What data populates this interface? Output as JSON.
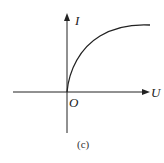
{
  "diagram": {
    "type": "I-U characteristic curve",
    "x_axis_label": "U",
    "y_axis_label": "I",
    "origin_label": "O",
    "caption": "(c)",
    "curve": "increasing, concave, saturating (plateau) from origin"
  },
  "colors": {
    "stroke": "#222222",
    "background": "#ffffff"
  }
}
